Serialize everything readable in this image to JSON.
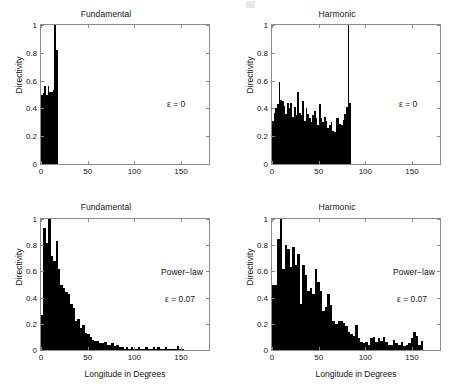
{
  "figure": {
    "panel_count": 4,
    "ylabel": "Directivity",
    "xlabel": "Longitude in Degrees",
    "ytick_labels": [
      "0",
      "0.2",
      "0.4",
      "0.6",
      "0.8",
      "1"
    ],
    "ytick_values": [
      0,
      0.2,
      0.4,
      0.6,
      0.8,
      1
    ],
    "xtick_labels": [
      "0",
      "50",
      "100",
      "150"
    ],
    "xtick_values": [
      0,
      50,
      100,
      150
    ],
    "xlim": [
      0,
      180
    ],
    "ylim": [
      0,
      1
    ],
    "bar_color": "#000000",
    "axis_color": "#8a8a8a"
  },
  "panels": {
    "top_left": {
      "title": "Fundamental",
      "annotation_epsilon": "ε = 0"
    },
    "top_right": {
      "title": "Harmonic",
      "annotation_epsilon": "ε = 0"
    },
    "bottom_left": {
      "title": "Fundamental",
      "annotation_model": "Power−law",
      "annotation_epsilon": "ε = 0.07"
    },
    "bottom_right": {
      "title": "Harmonic",
      "annotation_model": "Power−law",
      "annotation_epsilon": "ε = 0.07"
    }
  },
  "chart_data": [
    {
      "type": "bar",
      "panel": "top_left",
      "title": "Fundamental",
      "xlabel": "",
      "ylabel": "Directivity",
      "xlim": [
        0,
        180
      ],
      "ylim": [
        0,
        1
      ],
      "grid": false,
      "legend": false,
      "annotations": [
        "ε = 0"
      ],
      "bin_width": 1.8,
      "x": [
        0.9,
        2.7,
        4.5,
        6.3,
        8.1,
        9.9,
        11.7,
        13.5,
        15.3,
        17.1
      ],
      "values": [
        0.5,
        0.51,
        0.56,
        0.5,
        0.56,
        0.52,
        0.52,
        0.53,
        1.0,
        0.82
      ]
    },
    {
      "type": "bar",
      "panel": "top_right",
      "title": "Harmonic",
      "xlabel": "",
      "ylabel": "Directivity",
      "xlim": [
        0,
        180
      ],
      "ylim": [
        0,
        1
      ],
      "grid": false,
      "legend": false,
      "annotations": [
        "ε = 0"
      ],
      "bin_width": 1.8,
      "x": [
        0.9,
        2.7,
        4.5,
        6.3,
        8.1,
        9.9,
        11.7,
        13.5,
        15.3,
        17.1,
        18.9,
        20.7,
        22.5,
        24.3,
        26.1,
        27.9,
        29.7,
        31.5,
        33.3,
        35.1,
        36.9,
        38.7,
        40.5,
        42.3,
        44.1,
        45.9,
        47.7,
        49.5,
        51.3,
        53.1,
        54.9,
        56.7,
        58.5,
        60.3,
        62.1,
        63.9,
        65.7,
        67.5,
        69.3,
        71.1,
        72.9,
        74.7,
        76.5,
        78.3,
        80.1,
        81.9,
        83.7
      ],
      "values": [
        0.31,
        0.37,
        0.4,
        0.43,
        0.59,
        0.46,
        0.45,
        0.42,
        0.36,
        0.44,
        0.4,
        0.44,
        0.34,
        0.41,
        0.35,
        0.52,
        0.37,
        0.35,
        0.45,
        0.31,
        0.4,
        0.36,
        0.33,
        0.3,
        0.35,
        0.38,
        0.33,
        0.28,
        0.43,
        0.33,
        0.3,
        0.34,
        0.31,
        0.26,
        0.28,
        0.3,
        0.24,
        0.23,
        0.33,
        0.33,
        0.29,
        0.28,
        0.32,
        0.36,
        0.41,
        1.0,
        0.44
      ]
    },
    {
      "type": "bar",
      "panel": "bottom_left",
      "title": "Fundamental",
      "xlabel": "Longitude in Degrees",
      "ylabel": "Directivity",
      "xlim": [
        0,
        180
      ],
      "ylim": [
        0,
        1
      ],
      "grid": false,
      "legend": false,
      "annotations": [
        "Power−law",
        "ε = 0.07"
      ],
      "bin_width": 2.6,
      "x": [
        1.3,
        3.9,
        6.5,
        9.1,
        11.7,
        14.3,
        16.9,
        19.5,
        22.1,
        24.7,
        27.3,
        29.9,
        32.5,
        35.1,
        37.7,
        40.3,
        42.9,
        45.5,
        48.1,
        50.7,
        53.3,
        55.9,
        58.5,
        61.1,
        63.7,
        66.3,
        68.9,
        71.5,
        74.1,
        76.7,
        79.3,
        81.9,
        84.5,
        87.1,
        89.7,
        92.3,
        94.9,
        97.5,
        100.1,
        102.7,
        105.3,
        107.9,
        110.5,
        113.1,
        115.7,
        118.3,
        120.9,
        123.5,
        126.1,
        128.7,
        131.3,
        133.9,
        136.5,
        139.1,
        141.7,
        144.3,
        146.9,
        149.5,
        152.1
      ],
      "values": [
        0.27,
        0.93,
        0.82,
        1.0,
        0.72,
        0.68,
        0.83,
        0.62,
        0.5,
        0.47,
        0.44,
        0.43,
        0.35,
        0.32,
        0.22,
        0.24,
        0.17,
        0.19,
        0.13,
        0.12,
        0.1,
        0.08,
        0.07,
        0.07,
        0.05,
        0.05,
        0.06,
        0.04,
        0.04,
        0.05,
        0.03,
        0.04,
        0.02,
        0.02,
        0.01,
        0.02,
        0.01,
        0.02,
        0.01,
        0.01,
        0.02,
        0.01,
        0.01,
        0.02,
        0.01,
        0.01,
        0.02,
        0.01,
        0.02,
        0.01,
        0.01,
        0.02,
        0.01,
        0.01,
        0.0,
        0.01,
        0.03,
        0.01,
        0.0
      ]
    },
    {
      "type": "bar",
      "panel": "bottom_right",
      "title": "Harmonic",
      "xlabel": "Longitude in Degrees",
      "ylabel": "Directivity",
      "xlim": [
        0,
        180
      ],
      "ylim": [
        0,
        1
      ],
      "grid": false,
      "legend": false,
      "annotations": [
        "Power−law",
        "ε = 0.07"
      ],
      "bin_width": 2.7,
      "x": [
        1.35,
        4.05,
        6.75,
        9.45,
        12.15,
        14.85,
        17.55,
        20.25,
        22.95,
        25.65,
        28.35,
        31.05,
        33.75,
        36.45,
        39.15,
        41.85,
        44.55,
        47.25,
        49.95,
        52.65,
        55.35,
        58.05,
        60.75,
        63.45,
        66.15,
        68.85,
        71.55,
        74.25,
        76.95,
        79.65,
        82.35,
        85.05,
        87.75,
        90.45,
        93.15,
        95.85,
        98.55,
        101.25,
        103.95,
        106.65,
        109.35,
        112.05,
        114.75,
        117.45,
        120.15,
        122.85,
        125.55,
        128.25,
        130.95,
        133.65,
        136.35,
        139.05,
        141.75,
        144.45,
        147.15,
        149.85,
        152.55,
        155.25,
        157.95,
        160.65
      ],
      "values": [
        0.5,
        0.5,
        0.85,
        1.0,
        0.62,
        0.8,
        0.77,
        0.63,
        0.79,
        0.65,
        0.73,
        0.35,
        0.65,
        0.57,
        0.45,
        0.47,
        0.43,
        0.62,
        0.52,
        0.45,
        0.3,
        0.33,
        0.43,
        0.34,
        0.22,
        0.2,
        0.22,
        0.22,
        0.21,
        0.18,
        0.14,
        0.12,
        0.11,
        0.19,
        0.09,
        0.06,
        0.05,
        0.06,
        0.04,
        0.09,
        0.1,
        0.06,
        0.09,
        0.07,
        0.1,
        0.06,
        0.04,
        0.04,
        0.08,
        0.05,
        0.04,
        0.06,
        0.03,
        0.04,
        0.05,
        0.09,
        0.14,
        0.11,
        0.04,
        0.07
      ]
    }
  ]
}
